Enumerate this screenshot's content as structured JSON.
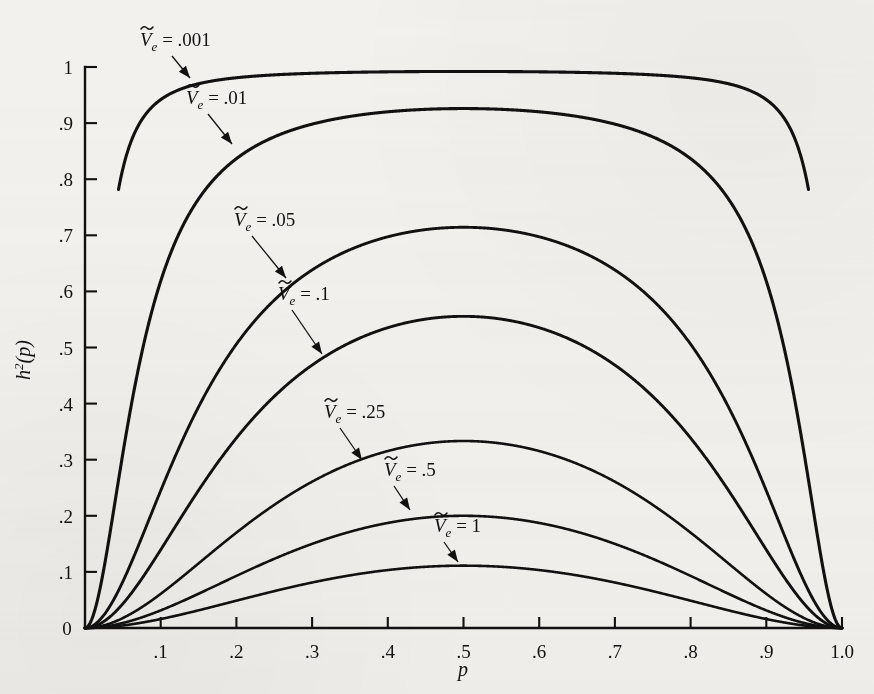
{
  "figure": {
    "background_color": "#f2f1ee",
    "ink_color": "#111111",
    "x_axis_title": "p",
    "y_axis_title_base": "h",
    "y_axis_title_exp": "2",
    "y_axis_title_arg": "(p)"
  },
  "chart_data": {
    "type": "line",
    "title": "",
    "subtitle": "",
    "xlabel": "p",
    "ylabel": "h²(p)",
    "xlim": [
      0,
      1.0
    ],
    "ylim": [
      0,
      1.0
    ],
    "grid": false,
    "legend_position": "inline-annotations",
    "x_tick_labels": [
      "0",
      ".1",
      ".2",
      ".3",
      ".4",
      ".5",
      ".6",
      ".7",
      ".8",
      ".9",
      "1.0"
    ],
    "x_tick_values": [
      0,
      0.1,
      0.2,
      0.3,
      0.4,
      0.5,
      0.6,
      0.7,
      0.8,
      0.9,
      1.0
    ],
    "y_tick_labels": [
      "0",
      ".1",
      ".2",
      ".3",
      ".4",
      ".5",
      ".6",
      ".7",
      ".8",
      ".9",
      "1"
    ],
    "y_tick_values": [
      0,
      0.1,
      0.2,
      0.3,
      0.4,
      0.5,
      0.6,
      0.7,
      0.8,
      0.9,
      1.0
    ],
    "formula": "h2(p) = 2p^2(1-p)^2 / (2p^2(1-p)^2 + Ve)",
    "x": [
      0.0,
      0.02,
      0.04,
      0.06,
      0.08,
      0.1,
      0.12,
      0.15,
      0.2,
      0.25,
      0.3,
      0.35,
      0.4,
      0.45,
      0.5,
      0.55,
      0.6,
      0.65,
      0.7,
      0.75,
      0.8,
      0.85,
      0.88,
      0.9,
      0.92,
      0.94,
      0.96,
      0.98,
      1.0
    ],
    "series": [
      {
        "name": "Ve = .001",
        "label": ".001",
        "Ve": 0.001,
        "peak_value": 1.0,
        "peak_at": 0.5,
        "truncated_left_at": 0.78,
        "truncated_right_at": 0.78,
        "values": [
          0.0,
          0.43,
          0.74,
          0.86,
          0.91,
          0.94,
          0.957,
          0.97,
          0.98,
          0.99,
          0.993,
          0.995,
          0.996,
          0.996,
          0.996,
          0.996,
          0.996,
          0.995,
          0.993,
          0.99,
          0.98,
          0.97,
          0.957,
          0.94,
          0.91,
          0.86,
          0.74,
          0.43,
          0.0
        ]
      },
      {
        "name": "Ve = .01",
        "label": ".01",
        "Ve": 0.01,
        "peak_value": 0.945,
        "peak_at": 0.5,
        "values": [
          0.0,
          0.07,
          0.22,
          0.41,
          0.52,
          0.62,
          0.69,
          0.76,
          0.84,
          0.88,
          0.91,
          0.92,
          0.926,
          0.927,
          0.927,
          0.927,
          0.926,
          0.92,
          0.91,
          0.88,
          0.84,
          0.76,
          0.69,
          0.62,
          0.52,
          0.41,
          0.22,
          0.07,
          0.0
        ]
      },
      {
        "name": "Ve = .05",
        "label": ".05",
        "Ve": 0.05,
        "peak_value": 0.72,
        "peak_at": 0.5,
        "values": [
          0.0,
          0.015,
          0.05,
          0.11,
          0.18,
          0.25,
          0.32,
          0.41,
          0.52,
          0.6,
          0.65,
          0.68,
          0.7,
          0.712,
          0.714,
          0.712,
          0.7,
          0.68,
          0.65,
          0.6,
          0.52,
          0.41,
          0.32,
          0.25,
          0.18,
          0.11,
          0.05,
          0.015,
          0.0
        ]
      },
      {
        "name": "Ve = .1",
        "label": ".1",
        "Ve": 0.1,
        "peak_value": 0.56,
        "peak_at": 0.5,
        "values": [
          0.0,
          0.008,
          0.026,
          0.058,
          0.1,
          0.145,
          0.19,
          0.26,
          0.35,
          0.43,
          0.48,
          0.52,
          0.54,
          0.553,
          0.556,
          0.553,
          0.54,
          0.52,
          0.48,
          0.43,
          0.35,
          0.26,
          0.19,
          0.145,
          0.1,
          0.058,
          0.026,
          0.008,
          0.0
        ]
      },
      {
        "name": "Ve = .25",
        "label": ".25",
        "Ve": 0.25,
        "peak_value": 0.34,
        "peak_at": 0.5,
        "values": [
          0.0,
          0.003,
          0.011,
          0.024,
          0.042,
          0.064,
          0.088,
          0.125,
          0.185,
          0.24,
          0.28,
          0.3,
          0.32,
          0.331,
          0.333,
          0.331,
          0.32,
          0.3,
          0.28,
          0.24,
          0.185,
          0.125,
          0.088,
          0.064,
          0.042,
          0.024,
          0.011,
          0.003,
          0.0
        ]
      },
      {
        "name": "Ve = .5",
        "label": ".5",
        "Ve": 0.5,
        "peak_value": 0.2,
        "peak_at": 0.5,
        "values": [
          0.0,
          0.0015,
          0.0055,
          0.012,
          0.021,
          0.033,
          0.046,
          0.067,
          0.102,
          0.136,
          0.162,
          0.181,
          0.193,
          0.199,
          0.2,
          0.199,
          0.193,
          0.181,
          0.162,
          0.136,
          0.102,
          0.067,
          0.046,
          0.033,
          0.021,
          0.012,
          0.0055,
          0.0015,
          0.0
        ]
      },
      {
        "name": "Ve = 1",
        "label": "1",
        "Ve": 1.0,
        "peak_value": 0.111,
        "peak_at": 0.5,
        "values": [
          0.0,
          0.0008,
          0.0028,
          0.006,
          0.011,
          0.017,
          0.024,
          0.035,
          0.054,
          0.073,
          0.088,
          0.099,
          0.106,
          0.11,
          0.111,
          0.11,
          0.106,
          0.099,
          0.088,
          0.073,
          0.054,
          0.035,
          0.024,
          0.017,
          0.011,
          0.006,
          0.0028,
          0.0008,
          0.0
        ]
      }
    ],
    "annotations": [
      {
        "text_v": "V",
        "text_sub": "e",
        "text_eq": " = .001",
        "label_x": 140,
        "label_y": 46,
        "arrow_from": [
          172,
          56
        ],
        "arrow_to": [
          190,
          78
        ]
      },
      {
        "text_v": "V",
        "text_sub": "e",
        "text_eq": " = .01",
        "label_x": 186,
        "label_y": 104,
        "arrow_from": [
          208,
          114
        ],
        "arrow_to": [
          232,
          144
        ]
      },
      {
        "text_v": "V",
        "text_sub": "e",
        "text_eq": " = .05",
        "label_x": 234,
        "label_y": 226,
        "arrow_from": [
          252,
          236
        ],
        "arrow_to": [
          286,
          278
        ]
      },
      {
        "text_v": "V",
        "text_sub": "e",
        "text_eq": " = .1",
        "label_x": 278,
        "label_y": 300,
        "arrow_from": [
          292,
          310
        ],
        "arrow_to": [
          322,
          354
        ]
      },
      {
        "text_v": "V",
        "text_sub": "e",
        "text_eq": " = .25",
        "label_x": 324,
        "label_y": 418,
        "arrow_from": [
          340,
          428
        ],
        "arrow_to": [
          362,
          460
        ]
      },
      {
        "text_v": "V",
        "text_sub": "e",
        "text_eq": " = .5",
        "label_x": 384,
        "label_y": 476,
        "arrow_from": [
          394,
          486
        ],
        "arrow_to": [
          410,
          510
        ]
      },
      {
        "text_v": "V",
        "text_sub": "e",
        "text_eq": " = 1",
        "label_x": 434,
        "label_y": 532,
        "arrow_from": [
          444,
          542
        ],
        "arrow_to": [
          458,
          562
        ]
      }
    ]
  }
}
